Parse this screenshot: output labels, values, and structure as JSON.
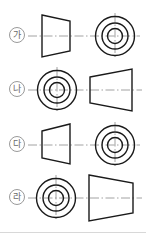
{
  "page": {
    "kind": "orthographic-projection-multiple-choice",
    "background_color": "#ffffff",
    "width": 146,
    "height": 236,
    "line_color": "#1a1a1a",
    "centerline_color": "#808080",
    "label_color": "#6a6a6a",
    "label_border_color": "#9a9a9a"
  },
  "choices": [
    {
      "id": "choice-ga",
      "label": "가",
      "row_top": 10,
      "left_view": {
        "type": "trapezoid",
        "name": "frustum-side-view",
        "taper": "right",
        "x": 40,
        "y": 14,
        "w": 42,
        "h": 40,
        "left_height": 40,
        "right_height": 26
      },
      "right_view": {
        "type": "concentric-circles",
        "name": "circles-front-view",
        "cx": 115,
        "cy": 36,
        "radii": [
          20,
          14,
          8
        ]
      }
    },
    {
      "id": "choice-na",
      "label": "나",
      "row_top": 63,
      "left_view": {
        "type": "concentric-circles",
        "name": "circles-front-view",
        "cx": 57,
        "cy": 89,
        "radii": [
          20,
          14,
          8
        ]
      },
      "right_view": {
        "type": "trapezoid",
        "name": "frustum-side-view",
        "taper": "left",
        "x": 89,
        "y": 70,
        "w": 44,
        "h": 40,
        "left_height": 26,
        "right_height": 40
      }
    },
    {
      "id": "choice-da",
      "label": "다",
      "row_top": 118,
      "left_view": {
        "type": "trapezoid",
        "name": "frustum-side-view",
        "taper": "left",
        "x": 40,
        "y": 124,
        "w": 42,
        "h": 40,
        "left_height": 26,
        "right_height": 40
      },
      "right_view": {
        "type": "concentric-circles",
        "name": "circles-front-view",
        "cx": 115,
        "cy": 144,
        "radii": [
          20,
          14,
          8
        ]
      }
    },
    {
      "id": "choice-ra",
      "label": "라",
      "row_top": 172,
      "left_view": {
        "type": "concentric-circles",
        "name": "circles-front-view",
        "cx": 56,
        "cy": 196,
        "radii": [
          20,
          14,
          8
        ]
      },
      "right_view": {
        "type": "trapezoid",
        "name": "frustum-side-view",
        "taper": "right",
        "x": 88,
        "y": 175,
        "w": 45,
        "h": 42,
        "left_height": 42,
        "right_height": 28
      }
    }
  ]
}
